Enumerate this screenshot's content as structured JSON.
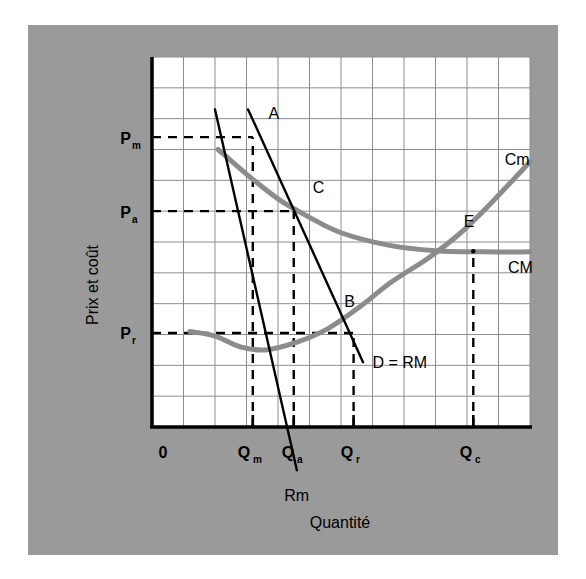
{
  "figure": {
    "background_color": "#9a9a9a",
    "plot_background_color": "#ffffff",
    "grid_color": "#8d8d8d",
    "axis_color": "#000000",
    "curve_color": "#8c8c8c",
    "line_color": "#000000"
  },
  "chart_data": {
    "type": "line",
    "title": "",
    "xlabel": "Quantité",
    "ylabel": "Prix et coût",
    "grid": true,
    "legend": "inline-labels",
    "xlim": [
      0,
      12
    ],
    "ylim": [
      0,
      12
    ],
    "x_tick_labels": [
      "0",
      "Qm",
      "Qa",
      "Qr",
      "Qc"
    ],
    "x_tick_labels_sub": [
      "",
      "m",
      "a",
      "r",
      "c"
    ],
    "x_tick_values": [
      0,
      3.2,
      4.5,
      6.4,
      10.2
    ],
    "y_tick_labels": [
      "Pm",
      "Pa",
      "Pr"
    ],
    "y_tick_labels_sub": [
      "m",
      "a",
      "r"
    ],
    "y_tick_values": [
      9.4,
      7.0,
      3.05
    ],
    "series": [
      {
        "name": "CM",
        "label": "CM",
        "type": "curve",
        "note": "Coût moyen — U-shaped, decreasing then flattening",
        "points": [
          [
            2.1,
            9.0
          ],
          [
            3.0,
            8.2
          ],
          [
            4.0,
            7.4
          ],
          [
            5.0,
            6.8
          ],
          [
            6.0,
            6.3
          ],
          [
            7.5,
            5.9
          ],
          [
            9.0,
            5.72
          ],
          [
            10.5,
            5.68
          ],
          [
            12.0,
            5.68
          ]
        ]
      },
      {
        "name": "Cm",
        "label": "Cm",
        "type": "curve",
        "note": "Coût marginal — U-shaped, minimum near Q=3.6",
        "points": [
          [
            1.2,
            3.1
          ],
          [
            2.0,
            2.95
          ],
          [
            2.8,
            2.6
          ],
          [
            3.6,
            2.5
          ],
          [
            4.6,
            2.75
          ],
          [
            5.6,
            3.2
          ],
          [
            6.6,
            3.9
          ],
          [
            7.6,
            4.7
          ],
          [
            8.8,
            5.5
          ],
          [
            9.8,
            6.3
          ],
          [
            10.8,
            7.3
          ],
          [
            12.0,
            8.6
          ]
        ]
      },
      {
        "name": "D = RM",
        "label": "D = RM",
        "type": "line",
        "note": "Demande / recette moyenne — downward sloping straight line",
        "points": [
          [
            3.05,
            10.3
          ],
          [
            6.7,
            2.1
          ]
        ]
      },
      {
        "name": "Rm",
        "label": "Rm",
        "type": "line",
        "note": "Recette marginale — steeper downward line, crosses below axis",
        "points": [
          [
            2.0,
            10.3
          ],
          [
            4.6,
            -1.4
          ]
        ]
      }
    ],
    "points": [
      {
        "label": "A",
        "x": 3.2,
        "y": 9.4,
        "note": "monopoly price point on demand at Qm"
      },
      {
        "label": "C",
        "x": 4.5,
        "y": 7.0,
        "note": "average-cost pricing: D=RM crosses CM"
      },
      {
        "label": "B",
        "x": 6.4,
        "y": 3.05,
        "note": "marginal-cost pricing: D=RM crosses Cm"
      },
      {
        "label": "E",
        "x": 10.2,
        "y": 5.7,
        "note": "Cm crosses CM at minimum of CM"
      }
    ],
    "dashed_guides": {
      "horizontal": [
        {
          "y": 9.4,
          "from_x": 0,
          "to_x": 3.2,
          "label": "Pm"
        },
        {
          "y": 7.0,
          "from_x": 0,
          "to_x": 4.5,
          "label": "Pa"
        },
        {
          "y": 3.05,
          "from_x": 0,
          "to_x": 6.4,
          "label": "Pr"
        }
      ],
      "vertical": [
        {
          "x": 3.2,
          "from_y": 0,
          "to_y": 9.4,
          "label": "Qm"
        },
        {
          "x": 4.5,
          "from_y": 0,
          "to_y": 7.0,
          "label": "Qa"
        },
        {
          "x": 6.4,
          "from_y": 0,
          "to_y": 3.05,
          "label": "Qr"
        },
        {
          "x": 10.2,
          "from_y": 0,
          "to_y": 5.7,
          "label": "Qc"
        }
      ]
    },
    "annotations": [
      {
        "text": "Cm",
        "x": 11.2,
        "y": 8.5
      },
      {
        "text": "CM",
        "x": 11.3,
        "y": 5.0
      },
      {
        "text": "D = RM",
        "x": 7.0,
        "y": 1.9
      },
      {
        "text": "Rm",
        "x": 4.2,
        "y": -2.4
      },
      {
        "text": "A",
        "x": 3.7,
        "y": 10.0
      },
      {
        "text": "B",
        "x": 6.1,
        "y": 3.9
      },
      {
        "text": "C",
        "x": 5.1,
        "y": 7.6
      },
      {
        "text": "E",
        "x": 9.9,
        "y": 6.5
      }
    ]
  }
}
